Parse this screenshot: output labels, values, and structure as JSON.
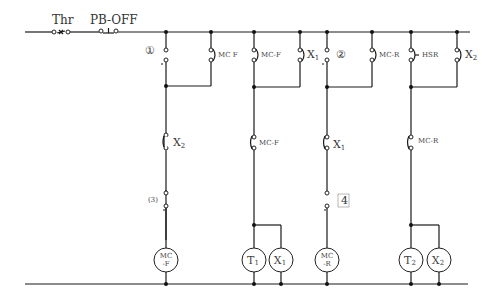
{
  "diagram": {
    "type": "relay ladder control circuit",
    "line_color": "#1a1a1a",
    "background": "#ffffff",
    "top_bus": {
      "components": [
        {
          "id": "thr",
          "label": "Thr",
          "kind": "thermal-relay-nc-contact"
        },
        {
          "id": "pb_off",
          "label": "PB-OFF",
          "kind": "pushbutton-nc-contact"
        }
      ]
    },
    "rungs": [
      {
        "id": "rung-1",
        "branches": [
          {
            "contact_marker": "①",
            "kind": "open-terminal-pair"
          },
          {
            "contact_label": "MC-F",
            "kind": "no-contact"
          }
        ],
        "series_contact": "X2",
        "lower_marker": "③",
        "coil": {
          "line1": "MC",
          "line2": "-F"
        }
      },
      {
        "id": "rung-2",
        "branches": [
          {
            "contact_label": "MC-F",
            "kind": "no-contact"
          },
          {
            "contact_label": "X1",
            "kind": "no-contact"
          }
        ],
        "series_contact": "MC-F",
        "coils": [
          {
            "label": "T1"
          },
          {
            "label": "X1"
          }
        ]
      },
      {
        "id": "rung-3",
        "branches": [
          {
            "contact_marker": "②",
            "kind": "open-terminal-pair"
          },
          {
            "contact_label": "MC-R",
            "kind": "no-contact"
          }
        ],
        "series_contact": "X1",
        "lower_marker": "④",
        "coil": {
          "line1": "MC",
          "line2": "-R"
        }
      },
      {
        "id": "rung-4",
        "branches": [
          {
            "contact_label": "HSR",
            "kind": "no-contact"
          },
          {
            "contact_label": "X2",
            "kind": "no-contact"
          }
        ],
        "series_contact": "MC-R",
        "coils": [
          {
            "label": "T2"
          },
          {
            "label": "X2"
          }
        ]
      }
    ]
  },
  "labels": {
    "thr": "Thr",
    "pb_off": "PB-OFF",
    "m1": "①",
    "m2": "②",
    "m3": "(3)",
    "m4": "4",
    "c_mcf_1": "MC F",
    "c_mcf_2": "MC-F",
    "c_x1_top": "X",
    "c_x1_top_sub": "1",
    "c_mcr_top": "MC-R",
    "c_hsr": "HSR",
    "c_x2_top": "X",
    "c_x2_top_sub": "2",
    "s_x2": "X",
    "s_x2_sub": "2",
    "s_mcf": "MC-F",
    "s_x1": "X",
    "s_x1_sub": "1",
    "s_mcr": "MC-R",
    "coil_mcf_1": "MC",
    "coil_mcf_2": "-F",
    "coil_t1": "T",
    "coil_t1_sub": "1",
    "coil_x1": "X",
    "coil_x1_sub": "1",
    "coil_mcr_1": "MC",
    "coil_mcr_2": "-R",
    "coil_t2": "T",
    "coil_t2_sub": "2",
    "coil_x2": "X",
    "coil_x2_sub": "2"
  }
}
